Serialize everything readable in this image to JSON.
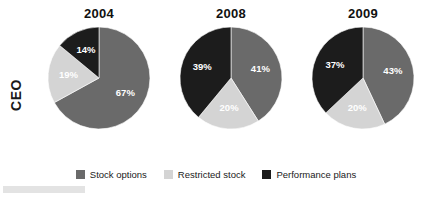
{
  "row_label": "CEO",
  "legend": {
    "items": [
      {
        "label": "Stock options",
        "color": "#6a6a6a",
        "key": "stock_options"
      },
      {
        "label": "Restricted stock",
        "color": "#d4d4d4",
        "key": "restricted_stock"
      },
      {
        "label": "Performance plans",
        "color": "#1c1c1c",
        "key": "performance_plans"
      }
    ]
  },
  "panels": [
    {
      "title": "2004",
      "labels": [
        "67%",
        "19%",
        "14%"
      ]
    },
    {
      "title": "2008",
      "labels": [
        "41%",
        "20%",
        "39%"
      ]
    },
    {
      "title": "2009",
      "labels": [
        "43%",
        "20%",
        "37%"
      ]
    }
  ],
  "chart_data": {
    "type": "pie",
    "title": "CEO",
    "xlabel": "",
    "ylabel": "",
    "series_names": [
      "Stock options",
      "Restricted stock",
      "Performance plans"
    ],
    "colors": [
      "#6a6a6a",
      "#d4d4d4",
      "#1c1c1c"
    ],
    "start_angle_deg": 0,
    "direction": "clockwise",
    "units": "percent",
    "legend_position": "bottom",
    "grid": false,
    "charts": [
      {
        "title": "2004",
        "categories": [
          "Stock options",
          "Restricted stock",
          "Performance plans"
        ],
        "values": [
          67,
          19,
          14
        ],
        "data_labels": [
          "67%",
          "19%",
          "14%"
        ]
      },
      {
        "title": "2008",
        "categories": [
          "Stock options",
          "Restricted stock",
          "Performance plans"
        ],
        "values": [
          41,
          20,
          39
        ],
        "data_labels": [
          "41%",
          "20%",
          "39%"
        ]
      },
      {
        "title": "2009",
        "categories": [
          "Stock options",
          "Restricted stock",
          "Performance plans"
        ],
        "values": [
          43,
          20,
          37
        ],
        "data_labels": [
          "43%",
          "20%",
          "37%"
        ]
      }
    ]
  }
}
